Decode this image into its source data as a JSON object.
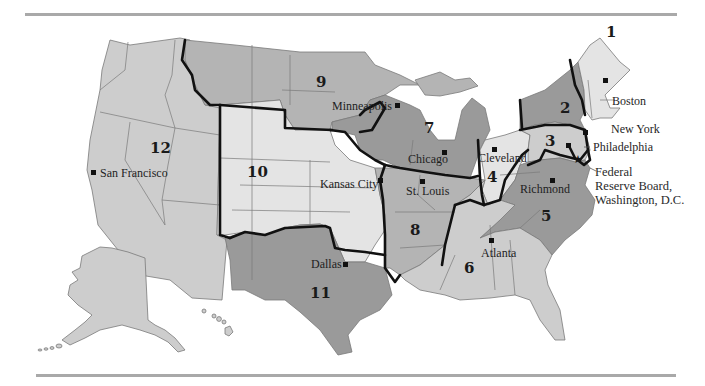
{
  "map": {
    "subject": "Federal Reserve Districts",
    "colors": {
      "light": "#e4e4e4",
      "light_medium": "#cdcdcd",
      "medium": "#b4b4b4",
      "dark": "#9a9a9a",
      "border": "#111111",
      "rule": "#a9a9a9"
    },
    "districts": [
      {
        "number": "1",
        "city": "Boston"
      },
      {
        "number": "2",
        "city": "New York"
      },
      {
        "number": "3",
        "city": "Philadelphia"
      },
      {
        "number": "4",
        "city": "Cleveland"
      },
      {
        "number": "5",
        "city": "Richmond"
      },
      {
        "number": "6",
        "city": "Atlanta"
      },
      {
        "number": "7",
        "city": "Chicago"
      },
      {
        "number": "8",
        "city": "St. Louis"
      },
      {
        "number": "9",
        "city": "Minneapolis"
      },
      {
        "number": "10",
        "city": "Kansas City"
      },
      {
        "number": "11",
        "city": "Dallas"
      },
      {
        "number": "12",
        "city": "San Francisco"
      }
    ],
    "board_label": {
      "line1": "Federal",
      "line2": "Reserve Board,",
      "line3": "Washington, D.C."
    }
  }
}
